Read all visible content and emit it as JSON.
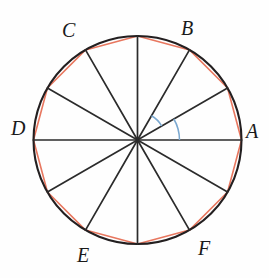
{
  "figure": {
    "background_color": "#fefefe",
    "circle": {
      "center_x": 137.5,
      "center_y": 140,
      "radius": 104,
      "stroke_color": "#231f20",
      "stroke_width": 2.1
    },
    "polygon": {
      "sides": 12,
      "stroke_color": "#e8775f",
      "stroke_width": 1.6,
      "fill": "none"
    },
    "spokes": {
      "count": 12,
      "angle_step_degrees": 30,
      "stroke_color": "#2b2b2b",
      "stroke_width": 1.7,
      "angles_degrees": [
        0,
        30,
        60,
        90,
        120,
        150,
        180,
        210,
        240,
        270,
        300,
        330
      ]
    },
    "angle_arcs": {
      "stroke_color": "#7aa8d0",
      "stroke_width": 1.5,
      "items": [
        {
          "name": "arc-0-to-30",
          "start_deg": 0,
          "end_deg": 30,
          "radius": 42
        },
        {
          "name": "arc-30-to-60",
          "start_deg": 30,
          "end_deg": 60,
          "radius": 28
        }
      ]
    },
    "labels": [
      {
        "id": "A",
        "text": "A",
        "angle_deg": 0,
        "x": 246,
        "y": 121
      },
      {
        "id": "B",
        "text": "B",
        "angle_deg": 60,
        "x": 181,
        "y": 18
      },
      {
        "id": "C",
        "text": "C",
        "angle_deg": 120,
        "x": 62,
        "y": 20
      },
      {
        "id": "D",
        "text": "D",
        "angle_deg": 180,
        "x": 11,
        "y": 118
      },
      {
        "id": "E",
        "text": "E",
        "angle_deg": 240,
        "x": 77,
        "y": 245
      },
      {
        "id": "F",
        "text": "F",
        "angle_deg": 300,
        "x": 198,
        "y": 238
      }
    ]
  }
}
